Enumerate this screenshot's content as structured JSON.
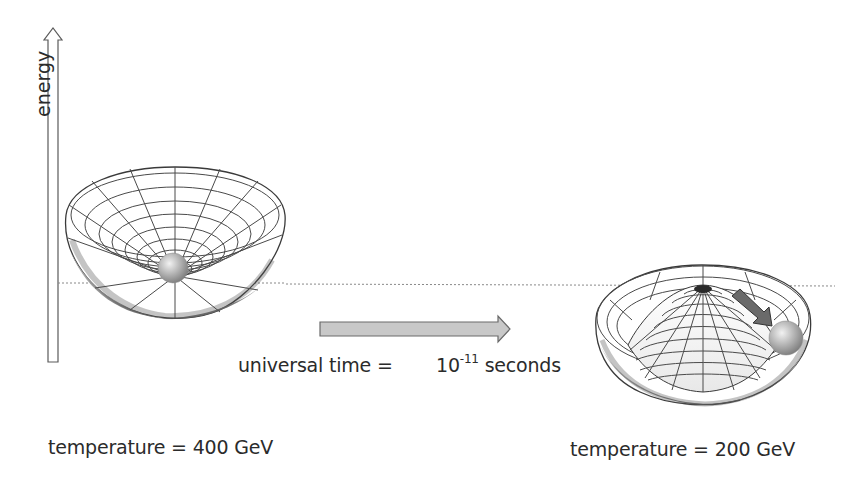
{
  "diagram": {
    "axis_label": "energy",
    "time_label": "universal time =",
    "time_base": "10",
    "time_exponent": "-11",
    "time_unit": "seconds",
    "left_state": {
      "temperature_label": "temperature = 400 GeV",
      "shape": "symmetric bowl with ball at minimum"
    },
    "right_state": {
      "temperature_label": "temperature = 200 GeV",
      "shape": "mexican-hat potential with ball rolling into trough"
    },
    "colors": {
      "arrow_fill": "#c8c8c8",
      "arrow_stroke": "#6a6a6a",
      "grid": "#4a4a4a",
      "ball": "#9a9a9a",
      "dotted_line": "#888888"
    }
  }
}
